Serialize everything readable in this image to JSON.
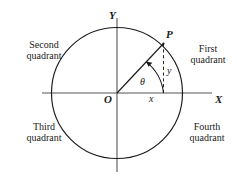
{
  "figure": {
    "type": "geometry-diagram",
    "background_color": "#ffffff",
    "stroke_color": "#1a1a1a",
    "axis_color": "#555555"
  },
  "axes": {
    "y_label": "Y",
    "x_label": "X",
    "origin_label": "O"
  },
  "point": {
    "label": "P",
    "x_component_label": "x",
    "y_component_label": "y"
  },
  "angle": {
    "label": "θ"
  },
  "quadrants": {
    "first": "First\nquadrant",
    "second": "Second\nquadrant",
    "third": "Third\nquadrant",
    "fourth": "Fourth\nquadrant"
  },
  "geometry": {
    "center_x": 117,
    "center_y": 93,
    "radius": 65,
    "point_x": 163,
    "point_y": 43,
    "angle_degrees": 47
  }
}
